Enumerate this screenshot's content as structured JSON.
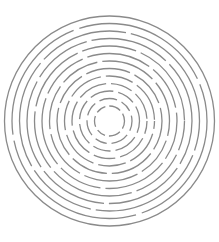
{
  "image": {
    "subject": "circular maze of concentric broken rings",
    "background": "#ffffff",
    "stroke_color": "#8a8a8a",
    "stroke_width": 1.3,
    "center": [
      109.5,
      121
    ],
    "rings": [
      {
        "r": 105,
        "dash": "",
        "offset": 0
      },
      {
        "r": 97.5,
        "dash": "140 6 160 6 130 6",
        "offset": 20
      },
      {
        "r": 90,
        "dash": "90 5 120 5 70 5 110 5",
        "offset": 60
      },
      {
        "r": 82.5,
        "dash": "60 5 80 5 70 5 90 5",
        "offset": 15
      },
      {
        "r": 75,
        "dash": "70 5 55 5 85 5 60 5",
        "offset": 40
      },
      {
        "r": 67.5,
        "dash": "50 5 65 5 45 5 70 5",
        "offset": 10
      },
      {
        "r": 60,
        "dash": "45 5 40 5 55 5 50 5",
        "offset": 30
      },
      {
        "r": 52.5,
        "dash": "35 5 45 5 38 5 50 5",
        "offset": 5
      },
      {
        "r": 45,
        "dash": "30 5 36 5 28 5 40 5",
        "offset": 22
      },
      {
        "r": 37.5,
        "dash": "25 5 30 5 22 5 28 5",
        "offset": 12
      },
      {
        "r": 30,
        "dash": "20 5 24 5 18 5 22 5",
        "offset": 8
      },
      {
        "r": 22.5,
        "dash": "14 5 18 5 12 5 16 5",
        "offset": 4
      },
      {
        "r": 15,
        "dash": "10 4 12 4 9 4 11 4",
        "offset": 2
      }
    ]
  }
}
